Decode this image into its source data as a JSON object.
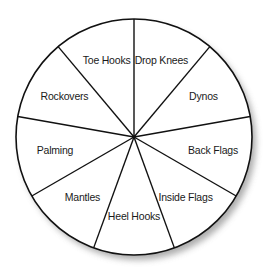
{
  "title": "",
  "wedges": [
    {
      "label": "Drop Knees"
    },
    {
      "label": "Dynos"
    },
    {
      "label": "Back Flags"
    },
    {
      "label": "Inside Flags"
    },
    {
      "label": "Heel Hooks"
    },
    {
      "label": "Mantles"
    },
    {
      "label": "Palming"
    },
    {
      "label": "Rockovers"
    },
    {
      "label": "Toe Hooks"
    }
  ],
  "colors": {
    "fill": "#ffffff",
    "stroke": "#111111",
    "shadow": "#9a9a9a"
  }
}
